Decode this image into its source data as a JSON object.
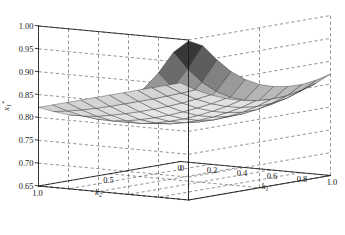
{
  "chart_data": {
    "type": "surface",
    "title": "",
    "xlabel": "k_1",
    "ylabel": "k_2",
    "zlabel": "x_1^*",
    "xlabel_display": "k",
    "xlabel_sub": "1",
    "ylabel_display": "k",
    "ylabel_sub": "2",
    "zlabel_display": "x",
    "zlabel_sub": "1",
    "zlabel_sup": "*",
    "xlim": [
      0,
      1
    ],
    "ylim": [
      0,
      1
    ],
    "zlim": [
      0.65,
      1.0
    ],
    "xticks": [
      0,
      0.2,
      0.4,
      0.6,
      0.8,
      1.0
    ],
    "xticklabels": [
      "0",
      "0.2",
      "0.4",
      "0.6",
      "0.8",
      "1.0"
    ],
    "yticks": [
      1.0,
      0.5,
      0
    ],
    "yticklabels": [
      "1.0",
      "0.5",
      "0"
    ],
    "zticks": [
      0.65,
      0.7,
      0.75,
      0.8,
      0.85,
      0.9,
      0.95,
      1.0
    ],
    "zticklabels": [
      "0.65",
      "0.70",
      "0.75",
      "0.80",
      "0.85",
      "0.90",
      "0.95",
      "1.00"
    ],
    "grid": true,
    "gridstyle": "dashed",
    "colormap": "gray",
    "legend": null,
    "nx": 11,
    "ny": 11,
    "x": [
      0,
      0.1,
      0.2,
      0.3,
      0.4,
      0.5,
      0.6,
      0.7,
      0.8,
      0.9,
      1.0
    ],
    "y": [
      0,
      0.1,
      0.2,
      0.3,
      0.4,
      0.5,
      0.6,
      0.7,
      0.8,
      0.9,
      1.0
    ],
    "z": [
      [
        0.822,
        0.81,
        0.802,
        0.797,
        0.796,
        0.798,
        0.804,
        0.814,
        0.829,
        0.848,
        0.872
      ],
      [
        0.822,
        0.808,
        0.798,
        0.791,
        0.788,
        0.789,
        0.794,
        0.804,
        0.818,
        0.838,
        0.864
      ],
      [
        0.822,
        0.807,
        0.795,
        0.787,
        0.783,
        0.783,
        0.787,
        0.796,
        0.811,
        0.832,
        0.86
      ],
      [
        0.822,
        0.806,
        0.793,
        0.784,
        0.779,
        0.779,
        0.783,
        0.792,
        0.808,
        0.83,
        0.861
      ],
      [
        0.822,
        0.806,
        0.792,
        0.782,
        0.777,
        0.777,
        0.781,
        0.791,
        0.808,
        0.832,
        0.866
      ],
      [
        0.822,
        0.806,
        0.792,
        0.782,
        0.777,
        0.777,
        0.782,
        0.793,
        0.812,
        0.838,
        0.876
      ],
      [
        0.822,
        0.806,
        0.793,
        0.783,
        0.779,
        0.78,
        0.787,
        0.799,
        0.82,
        0.85,
        0.892
      ],
      [
        0.822,
        0.807,
        0.795,
        0.786,
        0.783,
        0.786,
        0.795,
        0.81,
        0.834,
        0.868,
        0.915
      ],
      [
        0.822,
        0.809,
        0.798,
        0.791,
        0.791,
        0.796,
        0.808,
        0.827,
        0.855,
        0.894,
        0.946
      ],
      [
        0.822,
        0.812,
        0.804,
        0.8,
        0.803,
        0.812,
        0.828,
        0.851,
        0.884,
        0.928,
        0.982
      ],
      [
        0.822,
        0.816,
        0.812,
        0.813,
        0.82,
        0.834,
        0.855,
        0.884,
        0.922,
        0.97,
        0.998
      ]
    ],
    "zmin_observed": 0.777,
    "zmax_observed": 0.998,
    "edgecolor": "#1a1a1a",
    "axiscolor": "#1a1a1a",
    "background": "#ffffff"
  }
}
